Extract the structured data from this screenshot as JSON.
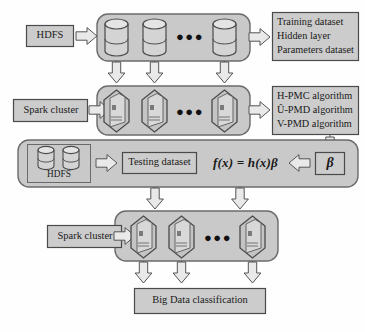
{
  "figure": {
    "type": "architecture-diagram",
    "background": "#fefefe",
    "band_fill": "#c9c9c9",
    "box_fill": "#cccccc",
    "stroke": "#4a4a4a"
  },
  "row1": {
    "source_label": "HDFS",
    "node_count": 3,
    "node_kind": "database-cylinder",
    "ellipsis": "●●●",
    "output_lines": [
      "Training dataset",
      "Hidden layer",
      "Parameters dataset"
    ]
  },
  "row2": {
    "source_label": "Spark cluster",
    "node_count": 3,
    "node_kind": "hexagon-server",
    "ellipsis": "●●●",
    "output_lines": [
      "H-PMC algorithm",
      "Û-PMD algorithm",
      "V-PMD algorithm"
    ]
  },
  "row3": {
    "storage_label": "HDFS",
    "storage_cylinders": 2,
    "testing_label": "Testing dataset",
    "formula": "f(x) = h(x)β",
    "beta_label": "β"
  },
  "row4": {
    "source_label": "Spark cluster",
    "node_count": 3,
    "node_kind": "hexagon-server",
    "ellipsis": "●●●"
  },
  "row5": {
    "result_label": "Big Data classification"
  }
}
